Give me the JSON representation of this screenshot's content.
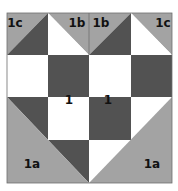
{
  "diagram": {
    "type": "quilt-block",
    "colors": {
      "light": "#a3a3a3",
      "dark": "#525252",
      "white": "#ffffff",
      "border": "#6e6e6e",
      "text": "#111111"
    },
    "labels": {
      "top_left": "1c",
      "top_mid_left": "1b",
      "top_mid_right": "1b",
      "top_right": "1c",
      "center_left": "1",
      "center_right": "1",
      "bottom_left": "1a",
      "bottom_right": "1a"
    }
  }
}
